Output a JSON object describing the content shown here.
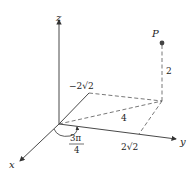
{
  "diagram": {
    "axes": {
      "x_label": "x",
      "y_label": "y",
      "z_label": "z"
    },
    "point": {
      "label": "P"
    },
    "labels": {
      "height": "2",
      "radius": "4",
      "x_coord": "−2√2",
      "y_coord": "2√2",
      "angle_num": "3π",
      "angle_den": "4"
    },
    "colors": {
      "line": "#333333",
      "dashed": "#555555",
      "point": "#444444"
    }
  }
}
